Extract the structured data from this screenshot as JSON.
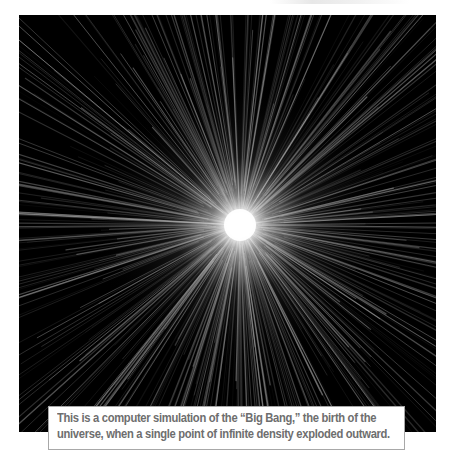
{
  "figure": {
    "background_color": "#000000",
    "core_color": "#ffffff",
    "ray_color": "#cfcfcf",
    "core_center_px": [
      240,
      225
    ]
  },
  "caption": {
    "text": "This is a computer simulation of the “Big Bang,” the birth of the universe, when a single point of infinite density exploded outward."
  }
}
